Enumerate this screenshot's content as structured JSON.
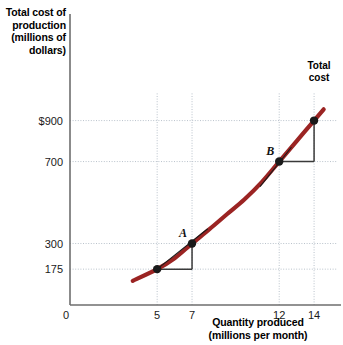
{
  "chart_data": {
    "type": "line",
    "title": "",
    "xlabel": "Quantity produced (millions per month)",
    "ylabel": "Total cost of production (millions of dollars)",
    "xlabel_line1": "Quantity produced",
    "xlabel_line2": "(millions per month)",
    "ylabel_line1": "Total cost of",
    "ylabel_line2": "production",
    "ylabel_line3": "(millions of",
    "ylabel_line4": "dollars)",
    "origin_label": "0",
    "xlim": [
      0,
      15.2
    ],
    "ylim": [
      0,
      1020
    ],
    "grid": true,
    "legend_position": "inline-right",
    "series": [
      {
        "name": "Total cost",
        "label": "Total cost",
        "label_line1": "Total",
        "label_line2": "cost",
        "color": "#9B2423",
        "x": [
          3.6,
          5,
          6,
          7,
          8,
          9,
          10,
          11,
          12,
          13,
          14,
          14.55
        ],
        "y": [
          118,
          175,
          228,
          300,
          370,
          443,
          515,
          600,
          700,
          800,
          900,
          955
        ]
      }
    ],
    "xticks": [
      {
        "value": 5,
        "label": "5"
      },
      {
        "value": 7,
        "label": "7"
      },
      {
        "value": 12,
        "label": "12"
      },
      {
        "value": 14,
        "label": "14"
      }
    ],
    "yticks": [
      {
        "value": 900,
        "label": "$900"
      },
      {
        "value": 700,
        "label": "700"
      },
      {
        "value": 300,
        "label": "300"
      },
      {
        "value": 175,
        "label": "175"
      }
    ],
    "points": [
      {
        "name": "A",
        "label": "A",
        "x": 7,
        "y": 300
      },
      {
        "name": "B",
        "label": "B",
        "x": 12,
        "y": 700
      },
      {
        "name": "",
        "label": "",
        "x": 5,
        "y": 175
      },
      {
        "name": "",
        "label": "",
        "x": 14,
        "y": 900
      }
    ],
    "slope_triangles": [
      {
        "name": "triangle-A",
        "x0": 5,
        "y0": 175,
        "x1": 7,
        "y1": 300
      },
      {
        "name": "triangle-B",
        "x0": 12,
        "y0": 700,
        "x1": 14,
        "y1": 900
      }
    ],
    "secants": [
      {
        "name": "secant-A",
        "x0": 5,
        "y0": 175,
        "x1": 7.9,
        "y1": 372
      },
      {
        "name": "secant-B",
        "x0": 10.9,
        "y0": 578,
        "x1": 12.7,
        "y1": 770
      }
    ],
    "colors": {
      "curve": "#9B2423",
      "grid": "#b9c2cb",
      "axis": "#6e6e6e",
      "point": "#1a1a1a",
      "triangle": "#3a3a3a",
      "text": "#000000"
    }
  }
}
